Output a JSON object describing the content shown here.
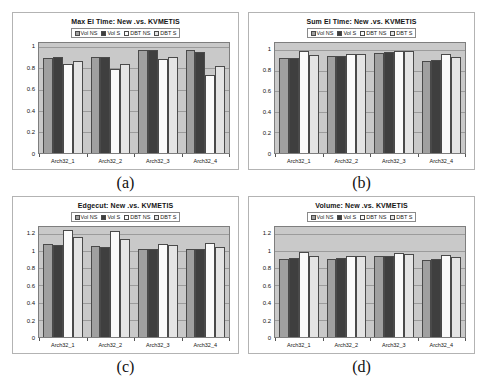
{
  "chart_data": [
    {
      "id": "a",
      "type": "bar",
      "title": "Max El Time: New .vs. KVMETIS",
      "caption": "(a)",
      "categories": [
        "Arch32_1",
        "Arch32_2",
        "Arch32_3",
        "Arch32_4"
      ],
      "series": [
        {
          "name": "Vol NS",
          "color": "#a0a0a0",
          "values": [
            0.9,
            0.91,
            0.97,
            0.97
          ]
        },
        {
          "name": "Vol S",
          "color": "#3f3f3f",
          "values": [
            0.91,
            0.91,
            0.97,
            0.96
          ]
        },
        {
          "name": "DBT NS",
          "color": "#fbfbfb",
          "values": [
            0.84,
            0.79,
            0.89,
            0.74
          ]
        },
        {
          "name": "DBT S",
          "color": "#e4e4e4",
          "values": [
            0.87,
            0.84,
            0.91,
            0.82
          ]
        }
      ],
      "yticks": [
        0,
        0.2,
        0.4,
        0.6,
        0.8,
        1
      ],
      "ylim": [
        0,
        1.04
      ],
      "grid": true,
      "legend_position": "top",
      "plot_background": "#c9c9c9"
    },
    {
      "id": "b",
      "type": "bar",
      "title": "Sum El Time: New .vs. KVMETIS",
      "caption": "(b)",
      "categories": [
        "Arch32_1",
        "Arch32_2",
        "Arch32_3",
        "Arch32_4"
      ],
      "series": [
        {
          "name": "Vol NS",
          "color": "#a0a0a0",
          "values": [
            0.92,
            0.94,
            0.97,
            0.9
          ]
        },
        {
          "name": "Vol S",
          "color": "#3f3f3f",
          "values": [
            0.92,
            0.94,
            0.98,
            0.91
          ]
        },
        {
          "name": "DBT NS",
          "color": "#fbfbfb",
          "values": [
            0.99,
            0.96,
            0.99,
            0.96
          ]
        },
        {
          "name": "DBT S",
          "color": "#e4e4e4",
          "values": [
            0.95,
            0.96,
            0.99,
            0.93
          ]
        }
      ],
      "yticks": [
        0,
        0.2,
        0.4,
        0.6,
        0.8,
        1
      ],
      "ylim": [
        0,
        1.07
      ],
      "grid": true,
      "legend_position": "top",
      "plot_background": "#c9c9c9"
    },
    {
      "id": "c",
      "type": "bar",
      "title": "Edgecut: New .vs. KVMETIS",
      "caption": "(c)",
      "categories": [
        "Arch32_1",
        "Arch32_2",
        "Arch32_3",
        "Arch32_4"
      ],
      "series": [
        {
          "name": "Vol NS",
          "color": "#a0a0a0",
          "values": [
            1.08,
            1.06,
            1.03,
            1.02
          ]
        },
        {
          "name": "Vol S",
          "color": "#3f3f3f",
          "values": [
            1.07,
            1.05,
            1.02,
            1.02
          ]
        },
        {
          "name": "DBT NS",
          "color": "#fbfbfb",
          "values": [
            1.25,
            1.23,
            1.08,
            1.1
          ]
        },
        {
          "name": "DBT S",
          "color": "#e4e4e4",
          "values": [
            1.16,
            1.14,
            1.07,
            1.05
          ]
        }
      ],
      "yticks": [
        0,
        0.2,
        0.4,
        0.6,
        0.8,
        1,
        1.2
      ],
      "ylim": [
        0,
        1.28
      ],
      "grid": true,
      "legend_position": "top",
      "plot_background": "#c9c9c9"
    },
    {
      "id": "d",
      "type": "bar",
      "title": "Volume: New .vs. KVMETIS",
      "caption": "(d)",
      "categories": [
        "Arch32_1",
        "Arch32_2",
        "Arch32_3",
        "Arch32_4"
      ],
      "series": [
        {
          "name": "Vol NS",
          "color": "#a0a0a0",
          "values": [
            0.91,
            0.91,
            0.94,
            0.9
          ]
        },
        {
          "name": "Vol S",
          "color": "#3f3f3f",
          "values": [
            0.92,
            0.92,
            0.94,
            0.91
          ]
        },
        {
          "name": "DBT NS",
          "color": "#fbfbfb",
          "values": [
            0.99,
            0.94,
            0.98,
            0.96
          ]
        },
        {
          "name": "DBT S",
          "color": "#e4e4e4",
          "values": [
            0.94,
            0.94,
            0.97,
            0.93
          ]
        }
      ],
      "yticks": [
        0,
        0.2,
        0.4,
        0.6,
        0.8,
        1,
        1.2
      ],
      "ylim": [
        0,
        1.28
      ],
      "grid": true,
      "legend_position": "top",
      "plot_background": "#c9c9c9"
    }
  ]
}
